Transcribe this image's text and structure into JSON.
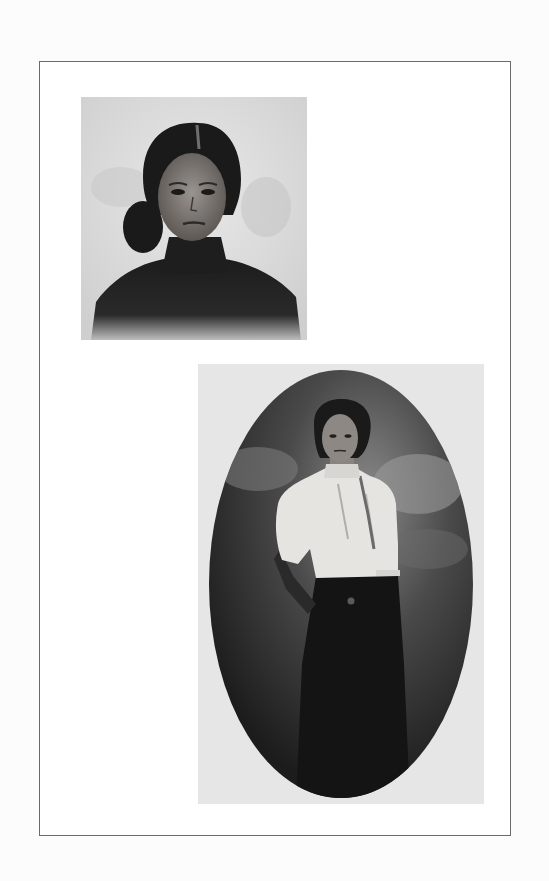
{
  "page": {
    "type": "photo plate",
    "background_color": "#fcfcfc",
    "frame_border_color": "#6a6a6a"
  },
  "photos": [
    {
      "id": "top",
      "description": "Vintage black-and-white head-and-shoulders portrait of a young woman with center-parted dark hair pulled back, wearing a dark high-collared garment, against a mottled light background",
      "shape": "rectangle",
      "tone": "sepia-gray"
    },
    {
      "id": "bottom",
      "description": "Vintage black-and-white three-quarter-length portrait of a young woman with short dark wavy hair, wearing a white puff-sleeved blouse with a ribbon tie and a long dark skirt, set in an oval vignette with a painted cloudy backdrop",
      "shape": "oval vignette",
      "tone": "sepia-gray"
    }
  ]
}
